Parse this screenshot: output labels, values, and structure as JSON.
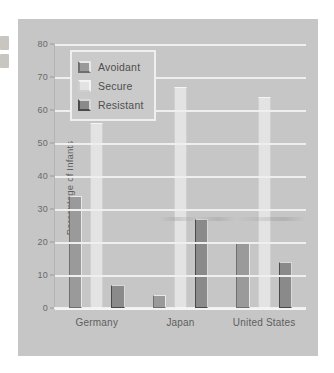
{
  "chart_data": {
    "type": "bar",
    "title": "",
    "xlabel": "",
    "ylabel": "Percentage of Infants",
    "ylim": [
      0,
      80
    ],
    "yticks": [
      0,
      10,
      20,
      30,
      40,
      50,
      60,
      70,
      80
    ],
    "ytick_labels": [
      "0",
      "10",
      "20",
      "30",
      "40",
      "50",
      "60",
      "70",
      "80"
    ],
    "grid": true,
    "legend_position": "upper-left",
    "categories": [
      "Germany",
      "Japan",
      "United States"
    ],
    "series": [
      {
        "name": "Avoidant",
        "values": [
          34,
          4,
          20
        ],
        "color": "#9a9a9a"
      },
      {
        "name": "Secure",
        "values": [
          56,
          67,
          64
        ],
        "color": "#e3e3e3"
      },
      {
        "name": "Resistant",
        "values": [
          7,
          27,
          14
        ],
        "color": "#8a8a8a"
      }
    ]
  },
  "legend": {
    "items": [
      {
        "label": "Avoidant",
        "swatch": "avoidant-swatch-icon"
      },
      {
        "label": "Secure",
        "swatch": "secure-swatch-icon"
      },
      {
        "label": "Resistant",
        "swatch": "resistant-swatch-icon"
      }
    ]
  },
  "colors": {
    "figure_background": "#c6c6c6",
    "gridline": "#efefef",
    "axis_text": "#5e5e5e",
    "avoidant": "#9a9a9a",
    "secure": "#e3e3e3",
    "resistant": "#8a8a8a"
  }
}
